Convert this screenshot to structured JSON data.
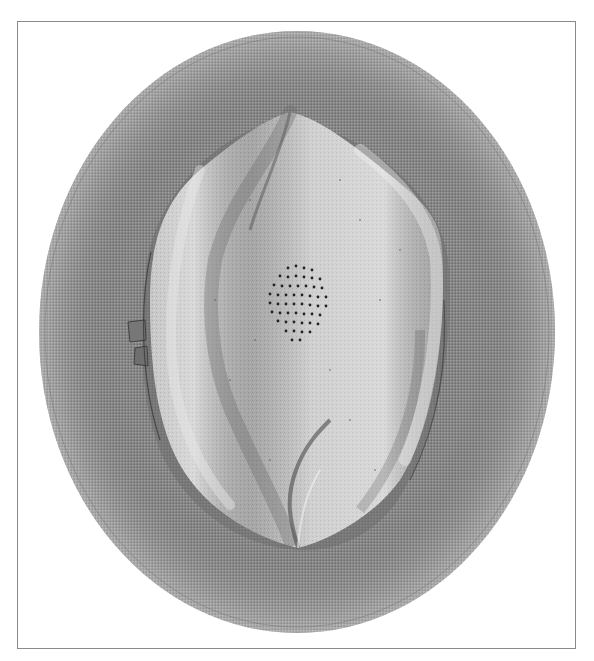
{
  "image": {
    "subject": "Hat viewed from above",
    "description": "Grayscale photograph of a straw hat with a wide round brim and a pinched teardrop-shaped crown with a cluster of ventilation holes",
    "colors": {
      "background": "#ffffff",
      "frame": "#8a8a8a",
      "brim": "#8c8c8c",
      "brim_dark": "#5f5f5f",
      "crown": "#bdbdbd",
      "crown_light": "#dcdcdc",
      "crown_shadow": "#7a7a7a",
      "band": "#7d7d7d",
      "holes": "#222222"
    },
    "frame_box": {
      "x": 17,
      "y": 21,
      "width": 559,
      "height": 628
    },
    "brim_ellipse": {
      "cx": 297,
      "cy": 332,
      "rx": 258,
      "ry": 301
    },
    "crown_tip_top": {
      "x": 290,
      "y": 112
    },
    "crown_tip_bottom": {
      "x": 298,
      "y": 548
    },
    "vent_holes_center": {
      "x": 300,
      "y": 305
    }
  }
}
